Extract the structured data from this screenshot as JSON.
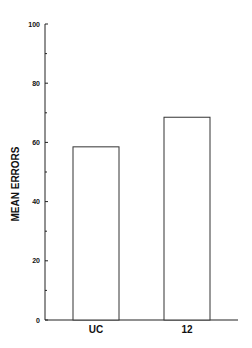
{
  "chart_data": {
    "type": "bar",
    "title": "",
    "xlabel": "",
    "ylabel": "MEAN ERRORS",
    "categories": [
      "UC",
      "12"
    ],
    "values": [
      58.5,
      68.5
    ],
    "ylim": [
      0,
      100
    ],
    "yticks": [
      0,
      20,
      40,
      60,
      80,
      100
    ],
    "ytick_labels": [
      "0",
      "20",
      "40",
      "60",
      "80",
      "100"
    ],
    "minor_yticks": [
      10,
      30,
      50,
      70,
      90
    ],
    "grid": false,
    "legend": null,
    "bar_fill": "#ffffff",
    "bar_stroke": "#333333"
  }
}
